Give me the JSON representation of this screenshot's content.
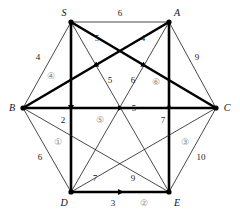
{
  "diagram": {
    "canvas": {
      "width": 240,
      "height": 217
    },
    "style": {
      "line_color": "#1a1a1a",
      "thick_line_color": "#000000",
      "circled_label_color": "#8c8c8c",
      "background": "#ffffff",
      "thin_width": 0.8,
      "thick_width": 2.6
    },
    "vertices": [
      {
        "id": "S",
        "label": "S",
        "x": 71,
        "y": 22,
        "label_x": 64,
        "label_y": 13
      },
      {
        "id": "A",
        "label": "A",
        "x": 169,
        "y": 22,
        "label_x": 177,
        "label_y": 13
      },
      {
        "id": "B",
        "label": "B",
        "x": 23,
        "y": 108,
        "label_x": 12,
        "label_y": 108
      },
      {
        "id": "C",
        "label": "C",
        "x": 216,
        "y": 108,
        "label_x": 227,
        "label_y": 108
      },
      {
        "id": "D",
        "label": "D",
        "x": 71,
        "y": 192,
        "label_x": 64,
        "label_y": 203
      },
      {
        "id": "E",
        "label": "E",
        "x": 169,
        "y": 192,
        "label_x": 177,
        "label_y": 203
      }
    ],
    "edges": [
      {
        "id": "S-A",
        "from": "S",
        "to": "A",
        "weight": "6",
        "thick": false,
        "arrow": "none",
        "wx": 120,
        "wy": 13
      },
      {
        "id": "S-B",
        "from": "S",
        "to": "B",
        "weight": "4",
        "thick": false,
        "arrow": "none",
        "wx": 38,
        "wy": 57
      },
      {
        "id": "S-D",
        "from": "S",
        "to": "D",
        "weight": "2",
        "thick": true,
        "arrow": "forward",
        "wx": 63,
        "wy": 120
      },
      {
        "id": "S-C",
        "from": "S",
        "to": "C",
        "weight": "5",
        "thick": true,
        "arrow": "forward",
        "wx": 97,
        "wy": 38
      },
      {
        "id": "S-E",
        "from": "S",
        "to": "E",
        "weight": "5",
        "thick": false,
        "arrow": "none",
        "wx": 110,
        "wy": 80
      },
      {
        "id": "A-C",
        "from": "A",
        "to": "C",
        "weight": "9",
        "thick": false,
        "arrow": "none",
        "wx": 197,
        "wy": 57
      },
      {
        "id": "A-B",
        "from": "A",
        "to": "B",
        "weight": "4",
        "thick": true,
        "arrow": "forward",
        "wx": 143,
        "wy": 38
      },
      {
        "id": "A-D",
        "from": "A",
        "to": "D",
        "weight": "6",
        "thick": false,
        "arrow": "none",
        "wx": 133,
        "wy": 80
      },
      {
        "id": "E-A",
        "from": "E",
        "to": "A",
        "weight": "7",
        "thick": true,
        "arrow": "forward",
        "wx": 163,
        "wy": 120
      },
      {
        "id": "B-C",
        "from": "B",
        "to": "C",
        "weight": "5",
        "thick": true,
        "arrow": "forward",
        "wx": 134,
        "wy": 108
      },
      {
        "id": "B-D",
        "from": "B",
        "to": "D",
        "weight": "6",
        "thick": false,
        "arrow": "none",
        "wx": 40,
        "wy": 157
      },
      {
        "id": "B-E",
        "from": "B",
        "to": "E",
        "weight": "9",
        "thick": false,
        "arrow": "none",
        "wx": 133,
        "wy": 178
      },
      {
        "id": "C-D",
        "from": "C",
        "to": "D",
        "weight": "7",
        "thick": false,
        "arrow": "none",
        "wx": 95,
        "wy": 178
      },
      {
        "id": "C-E",
        "from": "C",
        "to": "E",
        "weight": "10",
        "thick": false,
        "arrow": "none",
        "wx": 201,
        "wy": 157
      },
      {
        "id": "D-E",
        "from": "D",
        "to": "E",
        "weight": "3",
        "thick": true,
        "arrow": "forward",
        "wx": 113,
        "wy": 203
      }
    ],
    "circled_labels": [
      {
        "id": "circle-1",
        "text": "①",
        "x": 58,
        "y": 142
      },
      {
        "id": "circle-2",
        "text": "②",
        "x": 144,
        "y": 203
      },
      {
        "id": "circle-3",
        "text": "③",
        "x": 185,
        "y": 142
      },
      {
        "id": "circle-4",
        "text": "④",
        "x": 51,
        "y": 76
      },
      {
        "id": "circle-5",
        "text": "⑤",
        "x": 100,
        "y": 120
      },
      {
        "id": "circle-6",
        "text": "⑥",
        "x": 156,
        "y": 82
      }
    ]
  }
}
